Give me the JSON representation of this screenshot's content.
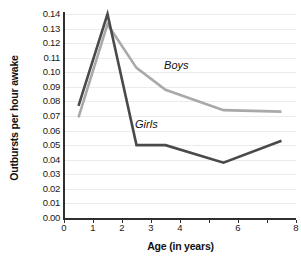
{
  "chart_data": {
    "type": "line",
    "title": "",
    "xlabel": "Age (in years)",
    "ylabel": "Outbursts per hour awake",
    "xlim": [
      0,
      8
    ],
    "ylim": [
      0,
      0.14
    ],
    "grid": true,
    "legend_position": "inline-annotation",
    "x": [
      0.5,
      1.5,
      2.5,
      3.5,
      5.5,
      7.5
    ],
    "xticks": [
      0,
      1,
      2,
      3,
      4,
      5,
      6,
      7,
      8
    ],
    "xtick_labels": [
      "0",
      "1",
      "2",
      "3",
      "4",
      "",
      "6",
      "",
      "8"
    ],
    "yticks": [
      0.0,
      0.01,
      0.02,
      0.03,
      0.04,
      0.05,
      0.06,
      0.07,
      0.08,
      0.09,
      0.1,
      0.11,
      0.12,
      0.13,
      0.14
    ],
    "ytick_labels": [
      "0.00",
      "0.01",
      "0.02",
      "0.03",
      "0.04",
      "0.05",
      "0.06",
      "0.07",
      "0.08",
      "0.09",
      "0.10",
      "0.11",
      "0.12",
      "0.13",
      "0.14"
    ],
    "series": [
      {
        "name": "Boys",
        "color": "#a9a9a9",
        "values": [
          0.069,
          0.133,
          0.103,
          0.088,
          0.074,
          0.073
        ],
        "annotation": "Boys"
      },
      {
        "name": "Girls",
        "color": "#4a4a4a",
        "values": [
          0.077,
          0.14,
          0.05,
          0.05,
          0.038,
          0.053
        ],
        "annotation": "Girls"
      }
    ],
    "annotations": [
      {
        "text": "Boys",
        "x": 3.45,
        "y": 0.104
      },
      {
        "text": "Girls",
        "x": 2.45,
        "y": 0.064
      }
    ]
  },
  "colors": {
    "axis": "#2f2f2f",
    "grid": "#eceaea",
    "background": "#ffffff",
    "boys": "#a9a9a9",
    "girls": "#4a4a4a"
  }
}
